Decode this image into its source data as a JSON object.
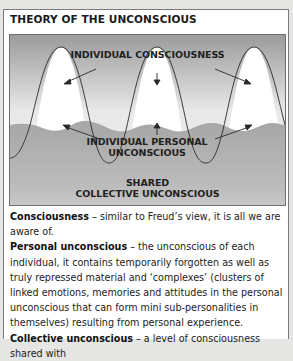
{
  "title": "THEORY OF THE UNCONSCIOUS",
  "diagram": {
    "labels": {
      "individual_consciousness": "INDIVIDUAL CONSCIOUSNESS",
      "individual_personal_unconscious_line1": "INDIVIDUAL PERSONAL",
      "individual_personal_unconscious_line2": "UNCONSCIOUS",
      "shared_line1": "SHARED",
      "collective_line2": "COLLECTIVE UNCONSCIOUS"
    },
    "colors": {
      "top_gradient": "#9a9a9a",
      "mid_gradient": "#e8e8e8",
      "band": "#a8a8a8",
      "bottom_gradient": "#d8d8d8",
      "peaks": "#ffffff"
    }
  },
  "definitions": [
    {
      "term": "Consciousness",
      "text": " – similar to Freud’s view, it is all we are aware of."
    },
    {
      "term": "Personal unconscious",
      "text": " – the unconscious of each individual, it contains temporarily forgotten as well as truly repressed material and ‘complexes’ (clusters of linked emotions, memories and attitudes in the personal unconscious that can form mini sub-personalities in themselves) resulting from personal experience."
    },
    {
      "term": "Collective unconscious",
      "text": " – a level of consciousness shared with"
    }
  ]
}
